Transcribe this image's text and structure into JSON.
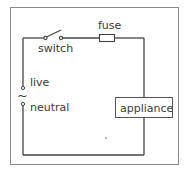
{
  "diagram": {
    "type": "circuit",
    "labels": {
      "switch": "switch",
      "fuse": "fuse",
      "live": "live",
      "ac_symbol": "~",
      "neutral": "neutral",
      "appliance": "appliance"
    },
    "colors": {
      "wire": "#444444",
      "frame": "#888888",
      "text": "#3a3a3a",
      "background": "#ffffff"
    }
  }
}
